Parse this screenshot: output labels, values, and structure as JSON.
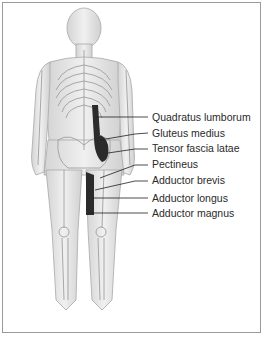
{
  "figure": {
    "view": "posterior",
    "labels": [
      {
        "text": "Quadratus lumborum",
        "y": 111,
        "target": [
          96,
          117
        ]
      },
      {
        "text": "Gluteus medius",
        "y": 127,
        "target": [
          100,
          140
        ]
      },
      {
        "text": "Tensor fascia latae",
        "y": 142,
        "target": [
          108,
          153
        ]
      },
      {
        "text": "Pectineus",
        "y": 158,
        "target": [
          100,
          178
        ]
      },
      {
        "text": "Adductor brevis",
        "y": 174,
        "target": [
          95,
          190
        ]
      },
      {
        "text": "Adductor longus",
        "y": 192,
        "target": [
          92,
          198
        ]
      },
      {
        "text": "Adductor magnus",
        "y": 207,
        "target": [
          88,
          213
        ]
      }
    ]
  },
  "colors": {
    "border": "#9a9a9a",
    "body_fill": "#e6e6e6",
    "bone": "#c8c8c8",
    "muscle": "#2b2b2b",
    "leader_line": "#1e1e1e",
    "label_text": "#2a2a2a"
  }
}
